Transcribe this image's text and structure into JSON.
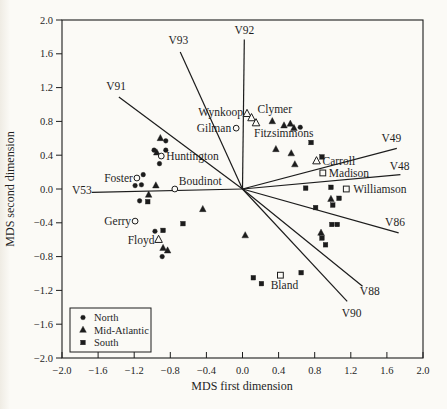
{
  "figure": {
    "background": "#fbfaf6",
    "ink": "#1c1c1c"
  },
  "chart_data": {
    "type": "scatter",
    "xlabel": "MDS first dimension",
    "ylabel": "MDS second dimension",
    "xlim": [
      -2.0,
      2.0
    ],
    "ylim": [
      -2.0,
      2.0
    ],
    "xticks": [
      -2.0,
      -1.6,
      -1.2,
      -0.8,
      -0.4,
      0.0,
      0.4,
      0.8,
      1.2,
      1.6,
      2.0
    ],
    "yticks": [
      -2.0,
      -1.6,
      -1.2,
      -0.8,
      -0.4,
      0.0,
      0.4,
      0.8,
      1.2,
      1.6,
      2.0
    ],
    "grid": false,
    "legend": {
      "position": "bottom-left",
      "entries": [
        {
          "label": "North",
          "marker": "circle"
        },
        {
          "label": "Mid-Atlantic",
          "marker": "triangle"
        },
        {
          "label": "South",
          "marker": "square"
        }
      ]
    },
    "series": [
      {
        "name": "North",
        "marker": "circle",
        "fill": "filled",
        "points": [
          [
            -0.85,
            0.57
          ],
          [
            -0.98,
            0.46
          ],
          [
            -0.85,
            0.46
          ],
          [
            -0.92,
            0.3
          ],
          [
            -1.1,
            0.17
          ],
          [
            -1.12,
            0.05
          ],
          [
            -1.19,
            0.04
          ],
          [
            -1.14,
            -0.14
          ],
          [
            -0.97,
            -0.5
          ],
          [
            -0.89,
            -0.8
          ],
          [
            0.64,
            0.73
          ]
        ]
      },
      {
        "name": "Mid-Atlantic",
        "marker": "triangle",
        "fill": "filled",
        "points": [
          [
            -0.91,
            0.6
          ],
          [
            -0.95,
            0.43
          ],
          [
            -0.96,
            0.04
          ],
          [
            -1.04,
            -0.07
          ],
          [
            -0.44,
            -0.24
          ],
          [
            -0.88,
            -0.7
          ],
          [
            -0.83,
            -0.73
          ],
          [
            0.33,
            0.8
          ],
          [
            0.46,
            0.75
          ],
          [
            0.53,
            0.77
          ],
          [
            0.57,
            0.72
          ],
          [
            0.37,
            0.47
          ],
          [
            0.54,
            0.42
          ],
          [
            0.58,
            0.29
          ],
          [
            0.03,
            -0.55
          ],
          [
            0.98,
            -0.12
          ],
          [
            0.87,
            -0.52
          ]
        ]
      },
      {
        "name": "South",
        "marker": "square",
        "fill": "filled",
        "points": [
          [
            -1.05,
            -0.15
          ],
          [
            -0.88,
            -0.49
          ],
          [
            -0.66,
            -0.41
          ],
          [
            0.76,
            0.55
          ],
          [
            0.88,
            0.38
          ],
          [
            0.7,
            0.01
          ],
          [
            0.98,
            0.02
          ],
          [
            1.07,
            -0.11
          ],
          [
            1.0,
            -0.19
          ],
          [
            0.81,
            -0.22
          ],
          [
            0.99,
            -0.42
          ],
          [
            1.05,
            -0.42
          ],
          [
            0.88,
            -0.58
          ],
          [
            0.92,
            -0.66
          ],
          [
            0.12,
            -1.05
          ],
          [
            0.21,
            -1.12
          ],
          [
            0.65,
            -0.99
          ]
        ]
      }
    ],
    "labeled_points": [
      {
        "label": "Gilman",
        "region": "North",
        "marker": "circle",
        "x": -0.07,
        "y": 0.72,
        "anchor": "end",
        "dx": -5,
        "dy": 3.5
      },
      {
        "label": "Huntington",
        "region": "North",
        "marker": "circle",
        "x": -0.9,
        "y": 0.39,
        "anchor": "start",
        "dx": 5,
        "dy": 4
      },
      {
        "label": "Foster",
        "region": "North",
        "marker": "circle",
        "x": -1.17,
        "y": 0.13,
        "anchor": "end",
        "dx": -4,
        "dy": 4
      },
      {
        "label": "Boudinot",
        "region": "North",
        "marker": "circle",
        "x": -0.75,
        "y": 0.0,
        "anchor": "start",
        "dx": 4,
        "dy": -4
      },
      {
        "label": "Gerry",
        "region": "North",
        "marker": "circle",
        "x": -1.19,
        "y": -0.38,
        "anchor": "end",
        "dx": -4,
        "dy": 4
      },
      {
        "label": "Wynkoop",
        "region": "Mid-Atlantic",
        "marker": "triangle",
        "x": 0.05,
        "y": 0.89,
        "anchor": "end",
        "dx": -4,
        "dy": 2
      },
      {
        "label": "Clymer",
        "region": "Mid-Atlantic",
        "marker": "triangle",
        "x": 0.1,
        "y": 0.84,
        "anchor": "start",
        "dx": 6,
        "dy": -5
      },
      {
        "label": "Fitzsimmons",
        "region": "Mid-Atlantic",
        "marker": "triangle",
        "x": 0.15,
        "y": 0.78,
        "anchor": "start",
        "dx": -2,
        "dy": 14
      },
      {
        "label": "Carroll",
        "region": "Mid-Atlantic",
        "marker": "triangle",
        "x": 0.82,
        "y": 0.33,
        "anchor": "start",
        "dx": 6,
        "dy": 4
      },
      {
        "label": "Floyd",
        "region": "Mid-Atlantic",
        "marker": "triangle",
        "x": -0.93,
        "y": -0.6,
        "anchor": "end",
        "dx": -4,
        "dy": 4
      },
      {
        "label": "Madison",
        "region": "South",
        "marker": "square",
        "x": 0.89,
        "y": 0.19,
        "anchor": "start",
        "dx": 6,
        "dy": 4
      },
      {
        "label": "Williamson",
        "region": "South",
        "marker": "square",
        "x": 1.15,
        "y": 0.0,
        "anchor": "start",
        "dx": 7,
        "dy": 4
      },
      {
        "label": "Bland",
        "region": "South",
        "marker": "square",
        "x": 0.42,
        "y": -1.02,
        "anchor": "middle",
        "dx": 4,
        "dy": 14
      }
    ],
    "vector_origin": [
      0,
      0
    ],
    "vectors": [
      {
        "label": "V93",
        "x": -0.69,
        "y": 1.62,
        "label_x": -0.71,
        "label_y": 1.72
      },
      {
        "label": "V92",
        "x": 0.02,
        "y": 1.77,
        "label_x": 0.02,
        "label_y": 1.84
      },
      {
        "label": "V91",
        "x": -1.37,
        "y": 1.09,
        "label_x": -1.4,
        "label_y": 1.17
      },
      {
        "label": "V53",
        "x": -1.67,
        "y": -0.04,
        "label_x": -1.78,
        "label_y": -0.06
      },
      {
        "label": "V49",
        "x": 1.71,
        "y": 0.48,
        "label_x": 1.65,
        "label_y": 0.56
      },
      {
        "label": "V48",
        "x": 1.75,
        "y": 0.17,
        "label_x": 1.74,
        "label_y": 0.22
      },
      {
        "label": "V86",
        "x": 1.73,
        "y": -0.52,
        "label_x": 1.69,
        "label_y": -0.44
      },
      {
        "label": "V88",
        "x": 1.33,
        "y": -1.15,
        "label_x": 1.41,
        "label_y": -1.26
      },
      {
        "label": "V90",
        "x": 1.16,
        "y": -1.33,
        "label_x": 1.21,
        "label_y": -1.52
      }
    ]
  }
}
